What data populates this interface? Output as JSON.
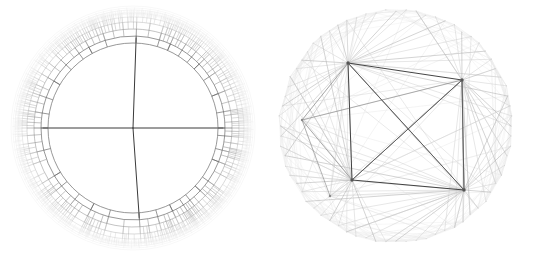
{
  "figure": {
    "background_color": "#ffffff",
    "width": 539,
    "height": 253,
    "panel_count": 2
  },
  "panels": [
    {
      "id": "radial-dendrogram",
      "name": "Radial dendrogram (circular hierarchical tree)",
      "center": {
        "x": 133,
        "y": 128
      },
      "outer_radius": 118,
      "inner_circle_radius": 85,
      "root_branch_radius": 90,
      "ring_count": 6,
      "leaf_count": 96,
      "colors": {
        "root_edge": "#3a3a3a",
        "level1_edge": "#6b6b6b",
        "level2_edge": "#9a9a9a",
        "level3_edge": "#bcbcbc",
        "level4_edge": "#d4d4d4",
        "level5_edge": "#e4e4e4",
        "outer_halo": "#efefef"
      },
      "root_splits": [
        {
          "label": "split-east",
          "angle_deg": 0
        },
        {
          "label": "split-west",
          "angle_deg": 180
        },
        {
          "label": "split-north",
          "angle_deg": 272
        },
        {
          "label": "split-south",
          "angle_deg": 86
        }
      ]
    },
    {
      "id": "circular-graph",
      "name": "Circular layout graph with four hub nodes",
      "center": {
        "x": 396,
        "y": 126
      },
      "outer_radius": 118,
      "perimeter_node_count": 72,
      "hub_count": 4,
      "colors": {
        "hub_edge": "#3a3a3a",
        "strong_edge": "#767676",
        "mid_edge": "#a8a8a8",
        "weak_edge": "#cfcfcf",
        "faint_edge": "#e6e6e6",
        "node_fill": "#555555"
      },
      "hubs": [
        {
          "label": "hub-top-left",
          "x": 348,
          "y": 63,
          "degree": 24
        },
        {
          "label": "hub-top-right",
          "x": 462,
          "y": 80,
          "degree": 18
        },
        {
          "label": "hub-bottom-right",
          "x": 464,
          "y": 190,
          "degree": 24
        },
        {
          "label": "hub-bottom-left",
          "x": 352,
          "y": 180,
          "degree": 18
        }
      ],
      "hub_edges": [
        {
          "from": "hub-top-left",
          "to": "hub-top-right",
          "weight": "strong"
        },
        {
          "from": "hub-top-right",
          "to": "hub-bottom-right",
          "weight": "strong"
        },
        {
          "from": "hub-bottom-right",
          "to": "hub-bottom-left",
          "weight": "strong"
        },
        {
          "from": "hub-bottom-left",
          "to": "hub-top-left",
          "weight": "strong"
        },
        {
          "from": "hub-top-left",
          "to": "hub-bottom-right",
          "weight": "strong"
        },
        {
          "from": "hub-top-right",
          "to": "hub-bottom-left",
          "weight": "strong"
        }
      ],
      "secondary_nodes": [
        {
          "label": "node-lower-left-fan",
          "x": 330,
          "y": 196,
          "degree": 14
        },
        {
          "label": "node-left-mid",
          "x": 302,
          "y": 120,
          "degree": 8
        }
      ]
    }
  ],
  "chart_data": {
    "type": "diagram",
    "subtype": [
      "radial-dendrogram",
      "circular-graph"
    ],
    "xlabel": "",
    "ylabel": "",
    "legend": [],
    "annotations": []
  }
}
